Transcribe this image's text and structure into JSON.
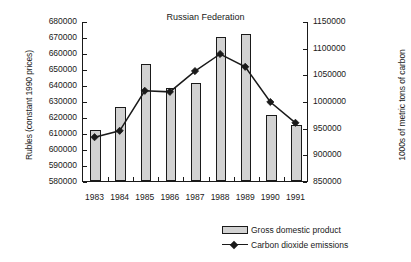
{
  "chart_data": {
    "type": "bar",
    "title": "Russian Federation",
    "xlabel": "",
    "categories": [
      "1983",
      "1984",
      "1985",
      "1986",
      "1987",
      "1988",
      "1989",
      "1990",
      "1991"
    ],
    "grid": false,
    "legend_position": "bottom-right",
    "series": [
      {
        "name": "Gross domestic product",
        "type": "bar",
        "axis": "left",
        "values": [
          612000,
          626000,
          653000,
          638000,
          641000,
          670000,
          672000,
          621000,
          615000
        ]
      },
      {
        "name": "Carbon dioxide emissions",
        "type": "line",
        "axis": "right",
        "values": [
          934000,
          946000,
          1021000,
          1019000,
          1058000,
          1090000,
          1066000,
          1000000,
          961000
        ]
      }
    ],
    "left_axis": {
      "label": "Rubles (constant 1990 prices)",
      "ylim": [
        580000,
        680000
      ],
      "ticks": [
        "680000",
        "670000",
        "660000",
        "650000",
        "640000",
        "630000",
        "620000",
        "610000",
        "600000",
        "590000",
        "580000"
      ]
    },
    "right_axis": {
      "label": "1000s of metric tons of carbon",
      "ylim": [
        850000,
        1150000
      ],
      "ticks": [
        "1150000",
        "1100000",
        "1050000",
        "1000000",
        "950000",
        "900000",
        "850000"
      ]
    },
    "legend": [
      {
        "label": "Gross domestic product",
        "marker": "bar-swatch"
      },
      {
        "label": "Carbon dioxide emissions",
        "marker": "line-diamond"
      }
    ]
  }
}
